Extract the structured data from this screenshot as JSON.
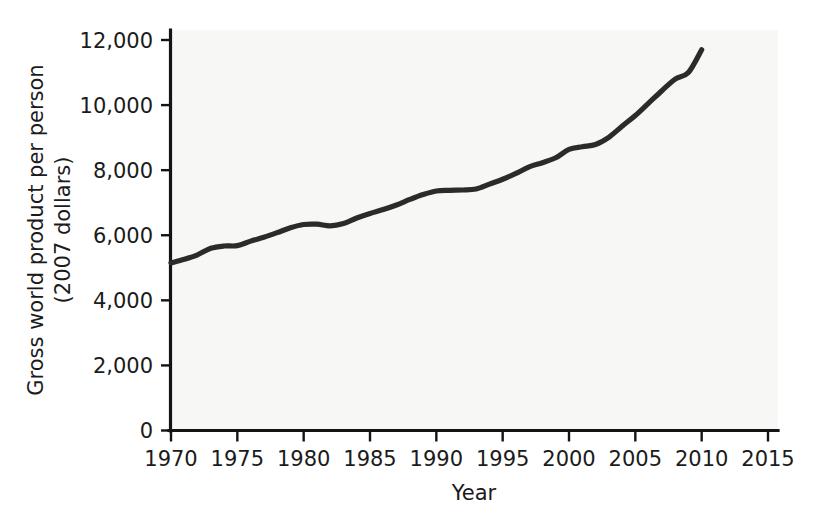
{
  "chart_data": {
    "type": "line",
    "title": "",
    "xlabel": "Year",
    "ylabel": "Gross world product per person (2007 dollars)",
    "ylabel_line1": "Gross world product per person",
    "ylabel_line2": "(2007 dollars)",
    "xlim": [
      1970,
      2015
    ],
    "ylim": [
      0,
      12000
    ],
    "grid": false,
    "legend": false,
    "x_ticks": [
      1970,
      1975,
      1980,
      1985,
      1990,
      1995,
      2000,
      2005,
      2010,
      2015
    ],
    "x_tick_labels": [
      "1970",
      "1975",
      "1980",
      "1985",
      "1990",
      "1995",
      "2000",
      "2005",
      "2010",
      "2015"
    ],
    "y_ticks": [
      0,
      2000,
      4000,
      6000,
      8000,
      10000,
      12000
    ],
    "y_tick_labels": [
      "0",
      "2,000",
      "4,000",
      "6,000",
      "8,000",
      "10,000",
      "12,000"
    ],
    "series": [
      {
        "name": "Gross world product per person",
        "color": "#2b2b2b",
        "x": [
          1970,
          1971,
          1972,
          1973,
          1974,
          1975,
          1976,
          1977,
          1978,
          1979,
          1980,
          1981,
          1982,
          1983,
          1984,
          1985,
          1986,
          1987,
          1988,
          1989,
          1990,
          1991,
          1992,
          1993,
          1994,
          1995,
          1996,
          1997,
          1998,
          1999,
          2000,
          2001,
          2002,
          2003,
          2004,
          2005,
          2006,
          2007,
          2008,
          2009,
          2010
        ],
        "values": [
          5150,
          5260,
          5400,
          5600,
          5670,
          5680,
          5820,
          5940,
          6080,
          6230,
          6330,
          6340,
          6290,
          6360,
          6530,
          6670,
          6790,
          6930,
          7100,
          7250,
          7360,
          7380,
          7390,
          7420,
          7570,
          7720,
          7900,
          8100,
          8230,
          8380,
          8640,
          8720,
          8790,
          9010,
          9350,
          9680,
          10060,
          10440,
          10800,
          11000,
          11700
        ]
      }
    ]
  },
  "axis": {
    "y_label_full": "Gross world product per person (2007 dollars)",
    "x_label": "Year"
  }
}
